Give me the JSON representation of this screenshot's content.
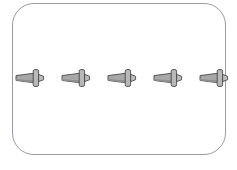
{
  "canvas": {
    "width": 237,
    "height": 170,
    "background": "#ffffff"
  },
  "panel": {
    "label": "rounded-panel",
    "x": 12,
    "y": 3,
    "width": 214,
    "height": 152,
    "corner_radius": 22,
    "border_color": "#9a9aa2",
    "border_width": 1,
    "fill": "#ffffff"
  },
  "icon_style": {
    "name": "rivet-icon",
    "outline_color": "#4a4a4a",
    "body_fill": "#a8a8a8",
    "head_fill": "#b8b8b8",
    "shadow_fill": "#8f8f8f",
    "tip_fill": "#bcbcbc"
  },
  "rivets": {
    "count": 5,
    "center_y": 78,
    "items": [
      {
        "name": "rivet-1",
        "x": 16,
        "clipped": false,
        "label": "Rivet 1"
      },
      {
        "name": "rivet-2",
        "x": 62,
        "clipped": false,
        "label": "Rivet 2"
      },
      {
        "name": "rivet-3",
        "x": 108,
        "clipped": false,
        "label": "Rivet 3"
      },
      {
        "name": "rivet-4",
        "x": 154,
        "clipped": false,
        "label": "Rivet 4"
      },
      {
        "name": "rivet-5",
        "x": 200,
        "clipped": true,
        "label": "Rivet 5"
      }
    ]
  }
}
